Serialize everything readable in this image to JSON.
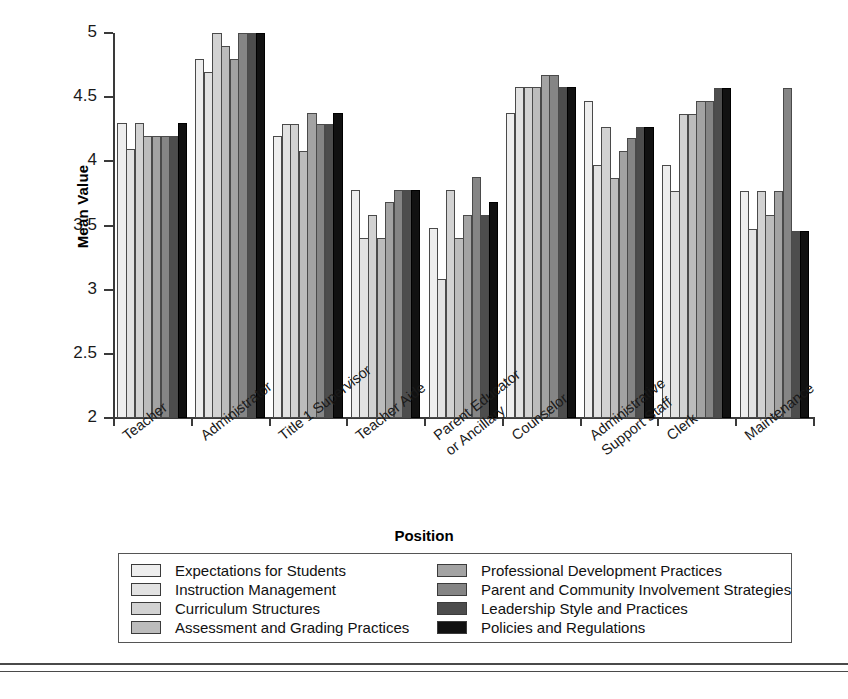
{
  "chart_data": {
    "type": "bar",
    "title": "",
    "xlabel": "Position",
    "ylabel": "Mean Value",
    "ylim": [
      2,
      5
    ],
    "yticks": [
      2,
      2.5,
      3,
      3.5,
      4,
      4.5,
      5
    ],
    "ytick_labels": [
      "2",
      "2.5",
      "3",
      "3.5",
      "4",
      "4.5",
      "5"
    ],
    "grid": false,
    "legend_position": "below-axes",
    "categories": [
      "Teacher",
      "Administrator",
      "Title 1 Supervisor",
      "Teacher Aide",
      "Parent Educator or Ancillary",
      "Counselor",
      "Administrative Support Staff",
      "Clerk",
      "Maintenance"
    ],
    "category_lines": [
      [
        "Teacher"
      ],
      [
        "Administrator"
      ],
      [
        "Title 1 Supervisor"
      ],
      [
        "Teacher Aide"
      ],
      [
        "Parent Educator",
        "or Ancillary"
      ],
      [
        "Counselor"
      ],
      [
        "Administrative",
        "Support Staff"
      ],
      [
        "Clerk"
      ],
      [
        "Maintenance"
      ]
    ],
    "series": [
      {
        "name": "Expectations for Students",
        "color": "#eeeeee",
        "values": [
          4.3,
          4.8,
          4.2,
          3.78,
          3.48,
          4.38,
          4.47,
          3.97,
          3.77
        ]
      },
      {
        "name": "Instruction Management",
        "color": "#e2e2e2",
        "values": [
          4.1,
          4.7,
          4.29,
          3.4,
          3.08,
          4.58,
          3.97,
          3.77,
          3.47
        ]
      },
      {
        "name": "Curriculum Structures",
        "color": "#d2d2d2",
        "values": [
          4.3,
          5.0,
          4.29,
          3.58,
          3.78,
          4.58,
          4.27,
          4.37,
          3.77
        ]
      },
      {
        "name": "Assessment and Grading Practices",
        "color": "#bcbcbc",
        "values": [
          4.2,
          4.9,
          4.08,
          3.4,
          3.4,
          4.58,
          3.87,
          4.37,
          3.58
        ]
      },
      {
        "name": "Professional Development Practices",
        "color": "#a3a3a3",
        "values": [
          4.2,
          4.8,
          4.38,
          3.68,
          3.58,
          4.67,
          4.08,
          4.47,
          3.77
        ]
      },
      {
        "name": "Parent and Community Involvement Strategies",
        "color": "#858585",
        "values": [
          4.2,
          5.0,
          4.29,
          3.78,
          3.88,
          4.67,
          4.18,
          4.47,
          4.57
        ]
      },
      {
        "name": "Leadership Style and Practices",
        "color": "#4d4d4d",
        "values": [
          4.2,
          5.0,
          4.29,
          3.78,
          3.58,
          4.58,
          4.27,
          4.57,
          3.46
        ]
      },
      {
        "name": "Policies and Regulations",
        "color": "#111111",
        "values": [
          4.3,
          5.0,
          4.38,
          3.78,
          3.68,
          4.58,
          4.27,
          4.57,
          3.46
        ]
      }
    ]
  },
  "legend": {
    "columns": [
      [
        "Expectations for Students",
        "Instruction Management",
        "Curriculum Structures",
        "Assessment and Grading Practices"
      ],
      [
        "Professional Development Practices",
        "Parent and Community Involvement Strategies",
        "Leadership Style and Practices",
        "Policies and Regulations"
      ]
    ]
  }
}
